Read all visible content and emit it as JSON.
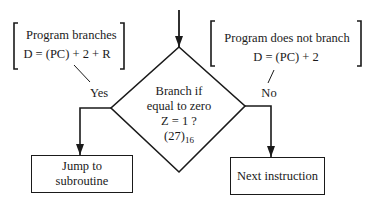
{
  "diagram": {
    "type": "flowchart",
    "decision": {
      "line1": "Branch if",
      "line2": "equal to zero",
      "line3": "Z = 1 ?",
      "opcode": "(27)",
      "opcode_base": "16"
    },
    "yes_branch": {
      "label": "Yes",
      "note_title": "Program branches",
      "note_formula": "D = (PC) + 2 + R",
      "target": "Jump to subroutine",
      "target_line1": "Jump to",
      "target_line2": "subroutine"
    },
    "no_branch": {
      "label": "No",
      "note_title": "Program does not branch",
      "note_formula": "D = (PC) + 2",
      "target": "Next instruction"
    },
    "colors": {
      "stroke": "#1a1a1a",
      "background": "#ffffff"
    }
  }
}
